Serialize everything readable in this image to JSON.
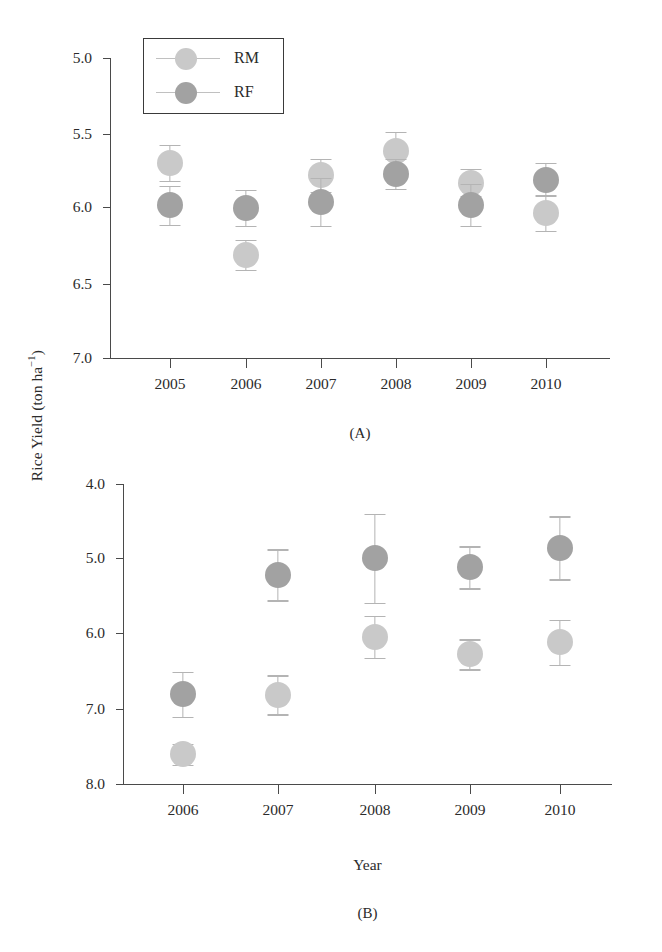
{
  "figure": {
    "y_axis_title": "Rice Yield (ton ha",
    "y_axis_title_sup": "−1",
    "y_axis_title_close": ")",
    "x_axis_title": "Year",
    "legend": {
      "items": [
        {
          "key": "RM",
          "label": "RM",
          "color": "#c9c9c9"
        },
        {
          "key": "RF",
          "label": "RF",
          "color": "#a2a2a2"
        }
      ]
    },
    "panels": [
      {
        "id": "A",
        "caption": "(A)"
      },
      {
        "id": "B",
        "caption": "(B)"
      }
    ]
  },
  "chart_data": [
    {
      "type": "scatter",
      "panel": "(A)",
      "title": "",
      "xlabel": "",
      "ylabel": "Rice Yield (ton ha -1)",
      "grid": false,
      "legend_position": "top-left",
      "categories": [
        "2005",
        "2006",
        "2007",
        "2008",
        "2009",
        "2010"
      ],
      "x": [
        2005,
        2006,
        2007,
        2008,
        2009,
        2010
      ],
      "xlim": [
        2004.5,
        2010.5
      ],
      "ylim": [
        5.0,
        7.0
      ],
      "yticks": [
        "5.0",
        "5.5",
        "6.0",
        "6.5",
        "7.0"
      ],
      "ytick_values": [
        5.0,
        5.5,
        6.0,
        6.5,
        7.0
      ],
      "series": [
        {
          "name": "RM",
          "color": "#c9c9c9",
          "values": [
            6.3,
            5.69,
            6.22,
            6.38,
            6.17,
            5.97
          ],
          "errors": [
            0.12,
            0.1,
            0.11,
            0.13,
            0.09,
            0.12
          ]
        },
        {
          "name": "RF",
          "color": "#a2a2a2",
          "values": [
            6.02,
            6.0,
            6.04,
            6.23,
            6.02,
            6.19
          ],
          "errors": [
            0.13,
            0.12,
            0.16,
            0.1,
            0.14,
            0.11
          ]
        }
      ]
    },
    {
      "type": "scatter",
      "panel": "(B)",
      "title": "",
      "xlabel": "Year",
      "ylabel": "Rice Yield (ton ha -1)",
      "grid": false,
      "legend_position": "none",
      "categories": [
        "2006",
        "2007",
        "2008",
        "2009",
        "2010"
      ],
      "x": [
        2006,
        2007,
        2008,
        2009,
        2010
      ],
      "xlim": [
        2005.5,
        2010.5
      ],
      "ylim": [
        4.0,
        8.0
      ],
      "yticks": [
        "4.0",
        "5.0",
        "6.0",
        "7.0",
        "8.0"
      ],
      "ytick_values": [
        4.0,
        5.0,
        6.0,
        7.0,
        8.0
      ],
      "series": [
        {
          "name": "RM",
          "color": "#c9c9c9",
          "values": [
            4.4,
            5.19,
            5.96,
            5.73,
            5.89
          ],
          "errors": [
            0.14,
            0.26,
            0.28,
            0.2,
            0.3
          ]
        },
        {
          "name": "RF",
          "color": "#a2a2a2",
          "values": [
            5.2,
            6.79,
            7.01,
            6.89,
            7.15
          ],
          "errors": [
            0.3,
            0.34,
            0.59,
            0.28,
            0.42
          ]
        }
      ]
    }
  ],
  "geometry": {
    "panelA": {
      "x0": 110,
      "x1": 610,
      "y_top": 58,
      "y_bottom": 358,
      "ymin": 5.0,
      "ymax": 7.0,
      "tick_x": [
        170,
        246,
        321,
        396,
        471,
        546
      ],
      "tick_y": [
        58,
        134,
        207,
        284,
        358
      ]
    },
    "panelB": {
      "x0": 123,
      "x1": 612,
      "y_top": 484,
      "y_bottom": 784,
      "ymin": 4.0,
      "ymax": 8.0,
      "tick_x": [
        183,
        278,
        375,
        470,
        560
      ],
      "tick_y": [
        484,
        558,
        633,
        709,
        784
      ]
    },
    "captionA_y": 425,
    "captionB_y": 905,
    "xtitle_y": 856
  }
}
